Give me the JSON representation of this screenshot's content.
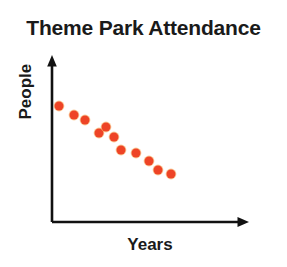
{
  "chart_data": {
    "type": "scatter",
    "title": "Theme Park Attendance",
    "xlabel": "Years",
    "ylabel": "People",
    "grid": false,
    "legend": null,
    "xlim": [
      0,
      11
    ],
    "ylim": [
      0,
      11
    ],
    "axis_ticks": false,
    "tick_labels": {
      "x": [],
      "y": []
    },
    "marker": {
      "shape": "circle",
      "color": "#ee4426",
      "edge_color": "#f5a24a",
      "size_px": 9
    },
    "series": [
      {
        "name": "Attendance",
        "x": [
          1,
          2,
          3,
          4,
          5,
          6,
          7,
          8,
          9,
          10,
          11
        ],
        "y": [
          10.0,
          9.2,
          8.8,
          7.8,
          7.8,
          6.7,
          6.4,
          5.8,
          5.1,
          4.8,
          4.5
        ]
      }
    ],
    "points_px": [
      {
        "x": 59,
        "y": 106
      },
      {
        "x": 74,
        "y": 115
      },
      {
        "x": 85,
        "y": 120
      },
      {
        "x": 99,
        "y": 133
      },
      {
        "x": 114,
        "y": 137
      },
      {
        "x": 121,
        "y": 150
      },
      {
        "x": 136,
        "y": 153
      },
      {
        "x": 149,
        "y": 161
      },
      {
        "x": 158,
        "y": 170
      },
      {
        "x": 171,
        "y": 174
      },
      {
        "x": 106,
        "y": 127
      }
    ],
    "axes": {
      "color": "#111111",
      "line_width": 2.6,
      "y_axis": {
        "x": 52,
        "y_top": 57,
        "y_bottom": 222,
        "arrow": "up"
      },
      "x_axis": {
        "y": 222,
        "x_left": 52,
        "x_right": 248,
        "arrow": "right"
      }
    },
    "trend": "decreasing"
  }
}
